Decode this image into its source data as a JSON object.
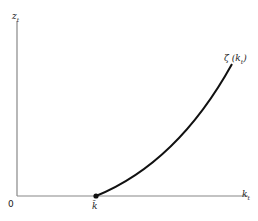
{
  "diagram": {
    "y_axis": {
      "label": "z",
      "subscript": "t"
    },
    "x_axis": {
      "label": "k",
      "subscript": "t"
    },
    "origin_label": "0",
    "point_label": "k̄",
    "curve_label": {
      "main": "ζ (k",
      "subscript": "t",
      "close": ")"
    },
    "colors": {
      "axis": "#888888",
      "curve": "#111111"
    }
  }
}
